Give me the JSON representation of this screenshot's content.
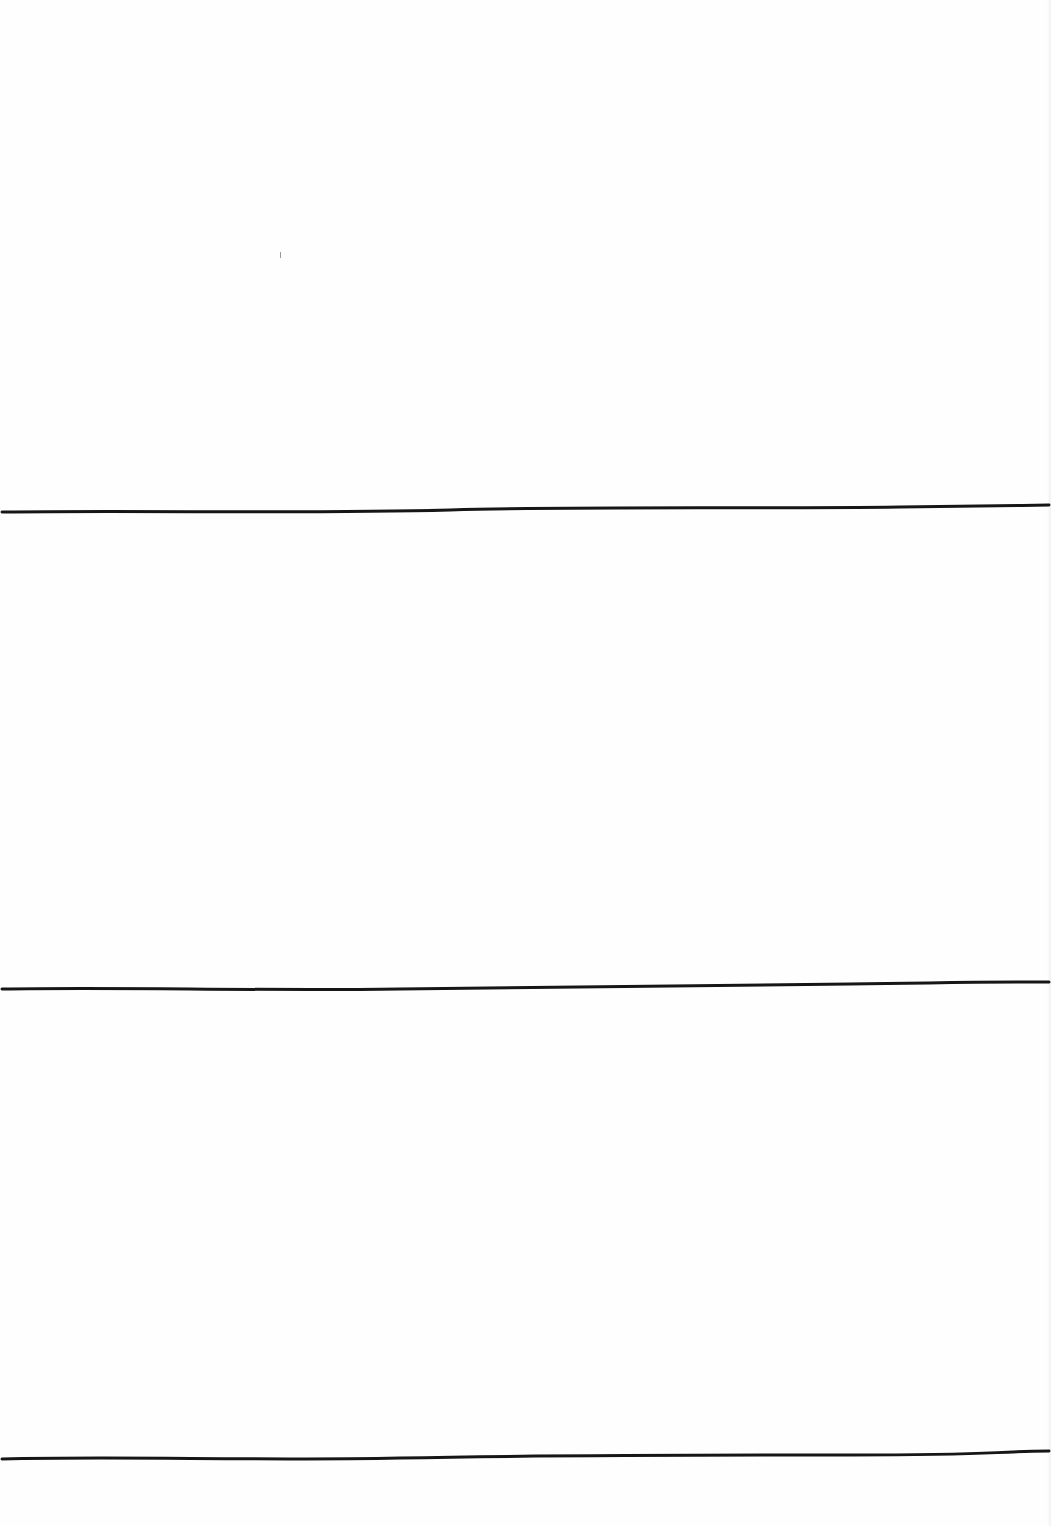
{
  "page": {
    "background": "#fefefe",
    "line_color": "#161616",
    "line_width": 3
  },
  "rules": [
    {
      "id": "rule-1",
      "y_left": 512,
      "y_mid": 510,
      "y_right": 505
    },
    {
      "id": "rule-2",
      "y_left": 989,
      "y_mid": 988,
      "y_right": 982
    },
    {
      "id": "rule-3",
      "y_left": 1459,
      "y_mid": 1457,
      "y_right": 1451
    }
  ],
  "artifacts": [
    {
      "x": 280,
      "y": 252
    }
  ]
}
